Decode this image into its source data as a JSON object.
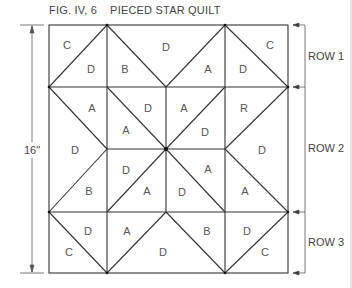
{
  "figure": {
    "number": "FIG. IV, 6",
    "title": "PIECED STAR QUILT",
    "dimension_label": "16\"",
    "rows": [
      {
        "label": "ROW 1",
        "y_top": 25,
        "y_bottom": 87
      },
      {
        "label": "ROW 2",
        "y_top": 87,
        "y_bottom": 212
      },
      {
        "label": "ROW 3",
        "y_top": 212,
        "y_bottom": 273
      }
    ]
  },
  "patches": [
    {
      "label": "C",
      "x": 67,
      "y": 45
    },
    {
      "label": "D",
      "x": 91,
      "y": 69
    },
    {
      "label": "B",
      "x": 125,
      "y": 69
    },
    {
      "label": "D",
      "x": 166,
      "y": 47
    },
    {
      "label": "A",
      "x": 208,
      "y": 69
    },
    {
      "label": "D",
      "x": 243,
      "y": 69
    },
    {
      "label": "C",
      "x": 270,
      "y": 45
    },
    {
      "label": "A",
      "x": 92,
      "y": 108
    },
    {
      "label": "D",
      "x": 148,
      "y": 108
    },
    {
      "label": "A",
      "x": 126,
      "y": 130
    },
    {
      "label": "A",
      "x": 184,
      "y": 108
    },
    {
      "label": "R",
      "x": 244,
      "y": 108
    },
    {
      "label": "D",
      "x": 205,
      "y": 132
    },
    {
      "label": "D",
      "x": 75,
      "y": 150
    },
    {
      "label": "D",
      "x": 262,
      "y": 150
    },
    {
      "label": "D",
      "x": 126,
      "y": 170
    },
    {
      "label": "A",
      "x": 208,
      "y": 169
    },
    {
      "label": "B",
      "x": 89,
      "y": 191
    },
    {
      "label": "A",
      "x": 147,
      "y": 191
    },
    {
      "label": "D",
      "x": 182,
      "y": 192
    },
    {
      "label": "A",
      "x": 245,
      "y": 191
    },
    {
      "label": "D",
      "x": 88,
      "y": 231
    },
    {
      "label": "A",
      "x": 127,
      "y": 231
    },
    {
      "label": "C",
      "x": 69,
      "y": 252
    },
    {
      "label": "D",
      "x": 163,
      "y": 252
    },
    {
      "label": "B",
      "x": 207,
      "y": 231
    },
    {
      "label": "D",
      "x": 247,
      "y": 231
    },
    {
      "label": "C",
      "x": 265,
      "y": 252
    }
  ]
}
